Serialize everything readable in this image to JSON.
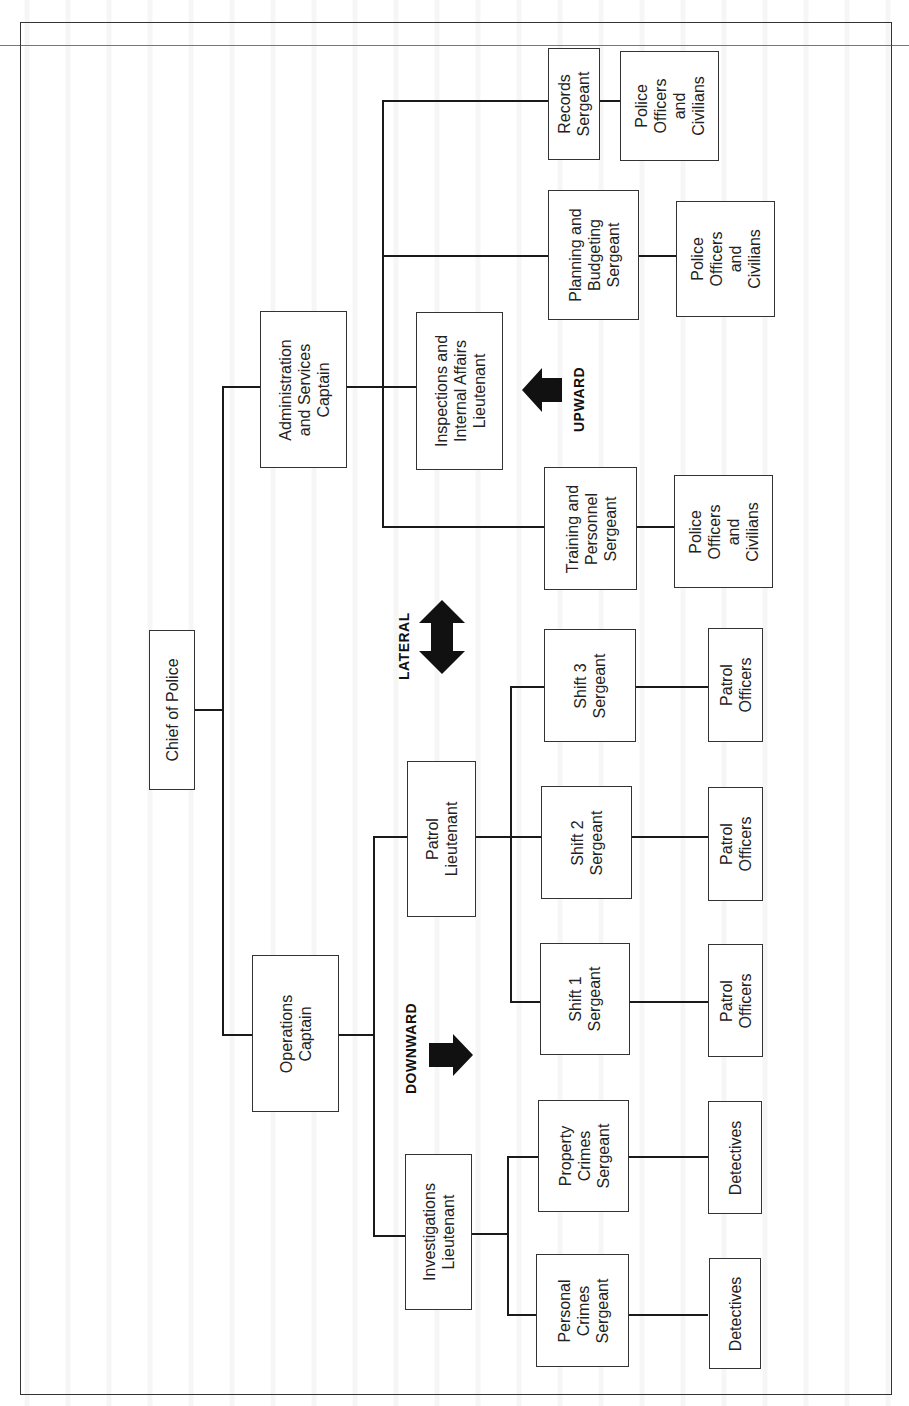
{
  "diagram": {
    "type": "organizational chart (rotated 90° counter-clockwise)",
    "orientation": "rotated-ccw",
    "root": {
      "id": "chief",
      "label": [
        "Chief of Police"
      ]
    },
    "nodes": {
      "chief": [
        "Chief of Police"
      ],
      "admin_captain": [
        "Administration",
        "and Services",
        "Captain"
      ],
      "ops_captain": [
        "Operations",
        "Captain"
      ],
      "inspections_lt": [
        "Inspections and",
        "Internal Affairs",
        "Lieutenant"
      ],
      "records_sgt": [
        "Records",
        "Sergeant"
      ],
      "records_staff": [
        "Police",
        "Officers",
        "and",
        "Civilians"
      ],
      "planning_sgt": [
        "Planning and",
        "Budgeting",
        "Sergeant"
      ],
      "planning_staff": [
        "Police",
        "Officers",
        "and",
        "Civilians"
      ],
      "training_sgt": [
        "Training and",
        "Personnel",
        "Sergeant"
      ],
      "training_staff": [
        "Police",
        "Officers",
        "and",
        "Civilians"
      ],
      "patrol_lt": [
        "Patrol",
        "Lieutenant"
      ],
      "shift3_sgt": [
        "Shift 3",
        "Sergeant"
      ],
      "shift3_staff": [
        "Patrol",
        "Officers"
      ],
      "shift2_sgt": [
        "Shift 2",
        "Sergeant"
      ],
      "shift2_staff": [
        "Patrol",
        "Officers"
      ],
      "shift1_sgt": [
        "Shift 1",
        "Sergeant"
      ],
      "shift1_staff": [
        "Patrol",
        "Officers"
      ],
      "investigations_lt": [
        "Investigations",
        "Lieutenant"
      ],
      "property_sgt": [
        "Property",
        "Crimes",
        "Sergeant"
      ],
      "property_staff": [
        "Detectives"
      ],
      "personal_sgt": [
        "Personal",
        "Crimes",
        "Sergeant"
      ],
      "personal_staff": [
        "Detectives"
      ]
    },
    "edges": [
      [
        "chief",
        "admin_captain"
      ],
      [
        "chief",
        "ops_captain"
      ],
      [
        "admin_captain",
        "inspections_lt"
      ],
      [
        "admin_captain",
        "records_sgt"
      ],
      [
        "admin_captain",
        "planning_sgt"
      ],
      [
        "admin_captain",
        "training_sgt"
      ],
      [
        "records_sgt",
        "records_staff"
      ],
      [
        "planning_sgt",
        "planning_staff"
      ],
      [
        "training_sgt",
        "training_staff"
      ],
      [
        "ops_captain",
        "patrol_lt"
      ],
      [
        "ops_captain",
        "investigations_lt"
      ],
      [
        "patrol_lt",
        "shift1_sgt"
      ],
      [
        "patrol_lt",
        "shift2_sgt"
      ],
      [
        "patrol_lt",
        "shift3_sgt"
      ],
      [
        "shift1_sgt",
        "shift1_staff"
      ],
      [
        "shift2_sgt",
        "shift2_staff"
      ],
      [
        "shift3_sgt",
        "shift3_staff"
      ],
      [
        "investigations_lt",
        "property_sgt"
      ],
      [
        "investigations_lt",
        "personal_sgt"
      ],
      [
        "property_sgt",
        "property_staff"
      ],
      [
        "personal_sgt",
        "personal_staff"
      ]
    ],
    "communication_arrows": {
      "upward": "UPWARD",
      "lateral": "LATERAL",
      "downward": "DOWNWARD"
    }
  },
  "colors": {
    "line": "#1a1a1a",
    "box_border": "#333333",
    "arrow_fill": "#111111",
    "background": "#ffffff"
  }
}
